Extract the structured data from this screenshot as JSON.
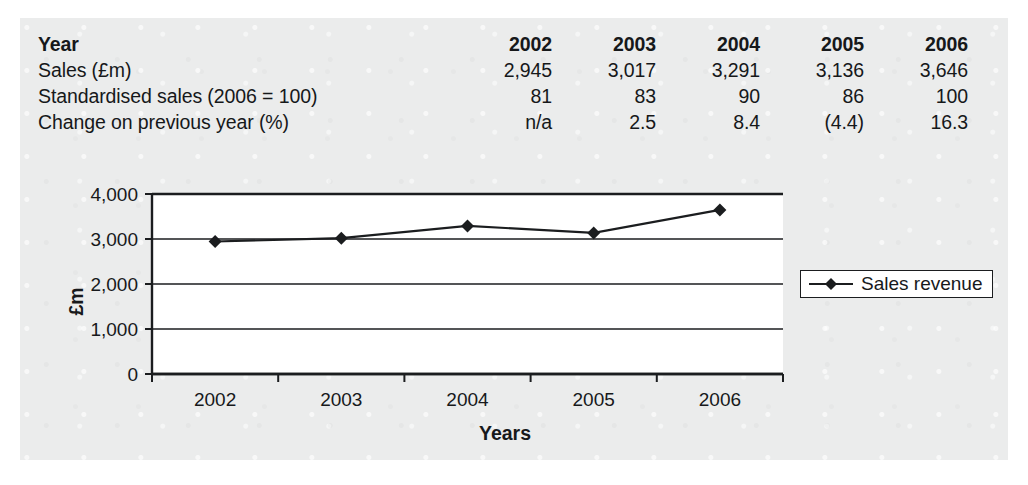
{
  "table": {
    "rows": [
      {
        "label": "Year",
        "header": true,
        "values": [
          "2002",
          "2003",
          "2004",
          "2005",
          "2006"
        ]
      },
      {
        "label": "Sales (£m)",
        "header": false,
        "values": [
          "2,945",
          "3,017",
          "3,291",
          "3,136",
          "3,646"
        ]
      },
      {
        "label": "Standardised sales (2006 = 100)",
        "header": false,
        "values": [
          "81",
          "83",
          "90",
          "86",
          "100"
        ]
      },
      {
        "label": "Change on previous year (%)",
        "header": false,
        "values": [
          "n/a",
          "2.5",
          "8.4",
          "(4.4)",
          "16.3"
        ]
      }
    ]
  },
  "chart_data": {
    "type": "line",
    "title": "",
    "xlabel": "Years",
    "ylabel": "£m",
    "categories": [
      "2002",
      "2003",
      "2004",
      "2005",
      "2006"
    ],
    "series": [
      {
        "name": "Sales revenue",
        "values": [
          2945,
          3017,
          3291,
          3136,
          3646
        ]
      }
    ],
    "ylim": [
      0,
      4000
    ],
    "yticks": [
      0,
      1000,
      2000,
      3000,
      4000
    ],
    "ytick_labels": [
      "0",
      "1,000",
      "2,000",
      "3,000",
      "4,000"
    ],
    "grid": true,
    "grid_axis": "y",
    "legend_position": "right",
    "marker": "diamond",
    "line_color": "#1b1d1f",
    "marker_color": "#1b1d1f",
    "plot_background": "#ffffff"
  },
  "colors": {
    "page_background": "#ebecec",
    "ink": "#16181a",
    "axis": "#1b1d1f"
  }
}
